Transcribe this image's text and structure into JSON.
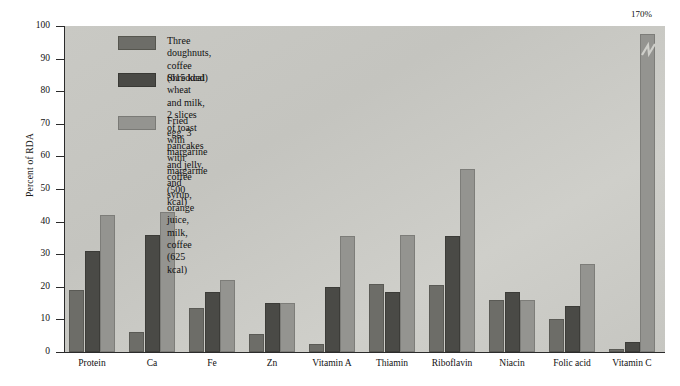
{
  "chart_data": {
    "type": "bar",
    "title": "",
    "xlabel": "",
    "ylabel": "Percent of RDA",
    "ylim": [
      0,
      100
    ],
    "yticks": [
      0,
      10,
      20,
      30,
      40,
      50,
      60,
      70,
      80,
      90,
      100
    ],
    "grid": false,
    "legend_position": "upper-left-inside",
    "categories": [
      "Protein",
      "Ca",
      "Fe",
      "Zn",
      "Vitamin A",
      "Thiamin",
      "Riboflavin",
      "Niacin",
      "Folic acid",
      "Vitamin C"
    ],
    "series": [
      {
        "name": "Three doughnuts, coffee (615 kcal)",
        "color": "#6d6d68",
        "values": [
          19,
          6,
          13.5,
          5.5,
          2.5,
          21,
          20.5,
          16,
          10,
          1
        ]
      },
      {
        "name": "Shredded wheat and milk, 2 slices of toast with margarine and jelly, coffee (500 kcal)",
        "color": "#4a4a46",
        "values": [
          31,
          36,
          18.5,
          15,
          20,
          18.5,
          35.5,
          18.5,
          14,
          3
        ]
      },
      {
        "name": "Fried egg, 3 pancakes with margarine and syrup, orange juice, milk, coffee (625 kcal)",
        "color": "#949490",
        "values": [
          42,
          43,
          22,
          15,
          35.5,
          36,
          56,
          16,
          27,
          170
        ]
      }
    ],
    "annotations": [
      {
        "text": "170%",
        "category": "Vitamin C",
        "series": "Fried egg, 3 pancakes with margarine and syrup, orange juice, milk, coffee (625 kcal)",
        "note": "bar-axis-break"
      }
    ]
  },
  "axis": {
    "y_title": "Percent of RDA",
    "y_tick_labels": [
      "0",
      "10",
      "20",
      "30",
      "40",
      "50",
      "60",
      "70",
      "80",
      "90",
      "100"
    ],
    "x_tick_labels": [
      "Protein",
      "Ca",
      "Fe",
      "Zn",
      "Vitamin A",
      "Thiamin",
      "Riboflavin",
      "Niacin",
      "Folic acid",
      "Vitamin C"
    ]
  },
  "legend": {
    "entries": [
      {
        "label": "Three doughnuts, coffee (615 kcal)"
      },
      {
        "label": "Shredded wheat and milk, 2 slices of toast\nwith margarine and jelly, coffee (500 kcal)"
      },
      {
        "label": "Fried egg, 3 pancakes with margarine and\nsyrup, orange juice, milk, coffee (625 kcal)"
      }
    ]
  },
  "callout": {
    "break_label": "170%"
  }
}
